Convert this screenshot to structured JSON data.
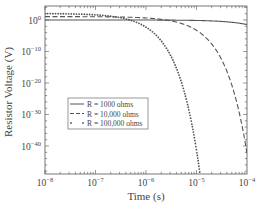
{
  "chart_data": {
    "type": "line",
    "title": "",
    "xlabel": "Time (s)",
    "ylabel": "Resistor Voltage (V)",
    "xscale": "log",
    "yscale": "log",
    "xlim": [
      1e-08,
      0.0001
    ],
    "ylim": [
      1e-49,
      100000.0
    ],
    "grid": false,
    "legend_position": "lower left (inside)",
    "x_ticks": [
      {
        "exp": "-8",
        "value": 1e-08
      },
      {
        "exp": "-7",
        "value": 1e-07
      },
      {
        "exp": "-6",
        "value": 1e-06
      },
      {
        "exp": "-5",
        "value": 1e-05
      },
      {
        "exp": "-4",
        "value": 0.0001
      }
    ],
    "y_ticks": [
      {
        "exp": "0",
        "value": 1
      },
      {
        "exp": "-10",
        "value": 1e-10
      },
      {
        "exp": "-20",
        "value": 1e-20
      },
      {
        "exp": "-30",
        "value": 1e-30
      },
      {
        "exp": "-40",
        "value": 1e-40
      }
    ],
    "series": [
      {
        "name": "R = 1000 ohms",
        "style": "solid",
        "x": [
          1e-08,
          1e-07,
          1e-06,
          1e-05,
          3e-05,
          6e-05,
          0.0001
        ],
        "y": [
          1,
          1,
          1,
          0.9,
          0.5,
          0.1,
          0.02
        ]
      },
      {
        "name": "R = 10,000 ohms",
        "style": "dashed",
        "x": [
          1e-08,
          1e-07,
          1e-06,
          3e-06,
          1e-05,
          3e-05,
          6e-05,
          0.0001
        ],
        "y": [
          10,
          9,
          3,
          0.1,
          0.0001,
          1e-13,
          1e-26,
          1e-44
        ]
      },
      {
        "name": "R = 100,000 ohms",
        "style": "dotted",
        "x": [
          1e-08,
          1e-07,
          3e-07,
          1e-06,
          2e-06,
          3e-06,
          5e-06,
          7e-06,
          1e-05,
          1.2e-05
        ],
        "y": [
          100,
          90,
          30,
          0.1,
          0.0001,
          1e-08,
          1e-16,
          1e-24,
          1e-36,
          1e-46
        ]
      }
    ],
    "colors": {
      "line": "#555555",
      "axis": "#555555",
      "text": "#444444"
    }
  }
}
